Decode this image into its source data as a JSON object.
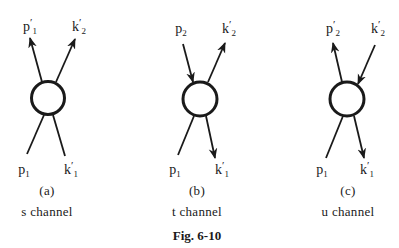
{
  "figure": {
    "caption": "Fig. 6-10",
    "panels": [
      {
        "id": "a",
        "sublabel": "(a)",
        "channel": "s channel",
        "labels": {
          "top_left": {
            "base": "p",
            "sub": "1",
            "prime": "′"
          },
          "top_right": {
            "base": "k",
            "sub": "2",
            "prime": "′"
          },
          "bottom_left": {
            "base": "p",
            "sub": "1",
            "prime": ""
          },
          "bottom_right": {
            "base": "k",
            "sub": "1",
            "prime": "′"
          }
        },
        "arrows": {
          "top_left": "outgoing",
          "top_right": "outgoing",
          "bottom_left": "incoming",
          "bottom_right": "incoming"
        }
      },
      {
        "id": "b",
        "sublabel": "(b)",
        "channel": "t channel",
        "labels": {
          "top_left": {
            "base": "p",
            "sub": "2",
            "prime": ""
          },
          "top_right": {
            "base": "k",
            "sub": "2",
            "prime": "′"
          },
          "bottom_left": {
            "base": "p",
            "sub": "1",
            "prime": ""
          },
          "bottom_right": {
            "base": "k",
            "sub": "1",
            "prime": "′"
          }
        },
        "arrows": {
          "top_left": "incoming",
          "top_right": "outgoing",
          "bottom_left": "incoming",
          "bottom_right": "outgoing"
        }
      },
      {
        "id": "c",
        "sublabel": "(c)",
        "channel": "u channel",
        "labels": {
          "top_left": {
            "base": "p",
            "sub": "2",
            "prime": "′"
          },
          "top_right": {
            "base": "k",
            "sub": "2",
            "prime": "′"
          },
          "bottom_left": {
            "base": "p",
            "sub": "1",
            "prime": ""
          },
          "bottom_right": {
            "base": "k",
            "sub": "1",
            "prime": "′"
          }
        },
        "arrows": {
          "top_left": "outgoing",
          "top_right": "incoming",
          "bottom_left": "incoming",
          "bottom_right": "outgoing"
        }
      }
    ]
  },
  "style": {
    "ink_color": "#1a1a1a",
    "background": "#ffffff"
  }
}
